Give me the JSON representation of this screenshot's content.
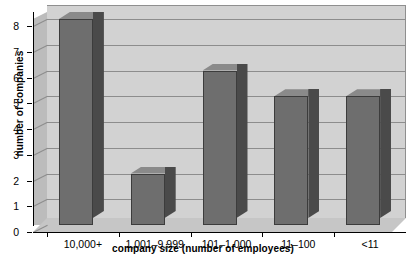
{
  "chart_data": {
    "type": "bar",
    "title": "",
    "xlabel": "company size (number of employees)",
    "ylabel": "number of companies",
    "categories": [
      "10,000+",
      "1,001–9,999",
      "101–1,000",
      "11–100",
      "<11"
    ],
    "values": [
      8,
      2,
      6,
      5,
      5
    ],
    "ylim": [
      0,
      8
    ],
    "ytick_labels": [
      "0",
      "1",
      "2",
      "3",
      "4",
      "5",
      "6",
      "7",
      "8"
    ],
    "ytick_values": [
      0,
      1,
      2,
      3,
      4,
      5,
      6,
      7,
      8
    ],
    "grid": true,
    "legend": "none",
    "style": "3d-column",
    "colors": {
      "bar_front": "#6e6e6e",
      "bar_side": "#4a4a4a",
      "bar_top": "#8a8a8a",
      "plot_background": "#d2d2d2",
      "wall_left": "#bcbcbc",
      "floor": "#c6c6c6",
      "gridline": "#8d8d8d",
      "axis": "#000000",
      "page_background": "#ffffff"
    }
  }
}
